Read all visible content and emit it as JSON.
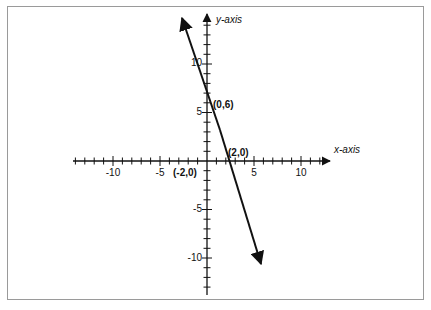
{
  "chart_data": {
    "type": "line",
    "title": "",
    "xlabel": "x-axis",
    "ylabel": "y-axis",
    "xlim": [
      -13,
      13
    ],
    "ylim": [
      -14,
      13
    ],
    "x_ticks": [
      -10,
      -5,
      5,
      10
    ],
    "y_ticks": [
      10,
      5,
      -5,
      -10
    ],
    "grid": false,
    "series": [
      {
        "name": "line y = -3x + 6",
        "x": [
          -2.7,
          0,
          2,
          5.7
        ],
        "y": [
          14.1,
          6,
          0,
          -11.1
        ],
        "arrows_both_ends": true
      }
    ],
    "annotations": [
      {
        "text": "(0,6)",
        "x": 0,
        "y": 6
      },
      {
        "text": "(2,0)",
        "x": 2,
        "y": 0
      },
      {
        "text": "(-2,0)",
        "x": -2,
        "y": 0
      }
    ]
  },
  "labels": {
    "x_axis": "x-axis",
    "y_axis": "y-axis",
    "x_ticks": [
      "-10",
      "-5",
      "5",
      "10"
    ],
    "y_ticks": [
      "10",
      "5",
      "-5",
      "-10"
    ],
    "points": [
      "(0,6)",
      "(2,0)",
      "(-2,0)"
    ]
  }
}
